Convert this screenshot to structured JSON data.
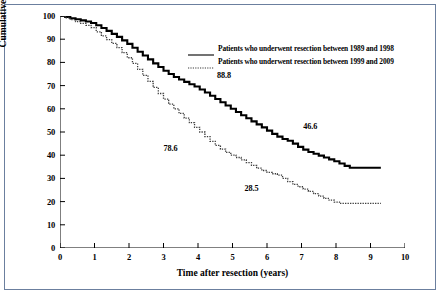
{
  "chart_data": {
    "type": "line",
    "title": "",
    "xlabel": "Time after resection (years)",
    "ylabel": "Cumulative survival (%)",
    "xlim": [
      0,
      10
    ],
    "ylim": [
      0,
      100
    ],
    "xticks": [
      "0",
      "1",
      "2",
      "3",
      "4",
      "5",
      "6",
      "7",
      "8",
      "9",
      "10"
    ],
    "yticks": [
      "0",
      "10",
      "20",
      "30",
      "40",
      "50",
      "60",
      "70",
      "80",
      "90",
      "100"
    ],
    "grid": false,
    "legend_position": "upper-right-inside",
    "series": [
      {
        "name": "Patients who underwent resection between 1989 and 1998",
        "style": "solid",
        "color": "#000000",
        "points": [
          [
            0.0,
            100.0
          ],
          [
            0.15,
            99.6
          ],
          [
            0.3,
            99.0
          ],
          [
            0.45,
            98.6
          ],
          [
            0.6,
            98.1
          ],
          [
            0.75,
            97.6
          ],
          [
            0.9,
            97.0
          ],
          [
            1.05,
            96.0
          ],
          [
            1.2,
            94.8
          ],
          [
            1.35,
            93.6
          ],
          [
            1.5,
            92.3
          ],
          [
            1.65,
            91.0
          ],
          [
            1.8,
            89.5
          ],
          [
            1.95,
            88.0
          ],
          [
            2.1,
            86.3
          ],
          [
            2.25,
            84.6
          ],
          [
            2.4,
            83.0
          ],
          [
            2.55,
            81.3
          ],
          [
            2.7,
            79.6
          ],
          [
            2.85,
            78.0
          ],
          [
            3.0,
            76.4
          ],
          [
            3.15,
            75.0
          ],
          [
            3.3,
            73.7
          ],
          [
            3.45,
            72.6
          ],
          [
            3.6,
            71.6
          ],
          [
            3.75,
            70.6
          ],
          [
            3.9,
            69.6
          ],
          [
            4.05,
            68.3
          ],
          [
            4.2,
            67.0
          ],
          [
            4.35,
            65.6
          ],
          [
            4.5,
            64.2
          ],
          [
            4.65,
            62.8
          ],
          [
            4.8,
            61.4
          ],
          [
            4.95,
            60.0
          ],
          [
            5.1,
            58.6
          ],
          [
            5.25,
            57.2
          ],
          [
            5.4,
            55.9
          ],
          [
            5.55,
            54.6
          ],
          [
            5.7,
            53.3
          ],
          [
            5.85,
            52.0
          ],
          [
            6.0,
            50.6
          ],
          [
            6.15,
            49.2
          ],
          [
            6.3,
            48.0
          ],
          [
            6.45,
            47.0
          ],
          [
            6.6,
            46.2
          ],
          [
            6.75,
            45.0
          ],
          [
            6.9,
            43.6
          ],
          [
            7.05,
            42.4
          ],
          [
            7.2,
            41.4
          ],
          [
            7.35,
            40.6
          ],
          [
            7.5,
            39.8
          ],
          [
            7.65,
            39.0
          ],
          [
            7.8,
            38.2
          ],
          [
            7.95,
            37.4
          ],
          [
            8.1,
            36.4
          ],
          [
            8.25,
            35.4
          ],
          [
            8.4,
            34.6
          ],
          [
            9.3,
            34.6
          ]
        ]
      },
      {
        "name": "Patients who underwent resection between 1999 and 2009",
        "style": "dotted",
        "color": "#3a3a3a",
        "points": [
          [
            0.0,
            100.0
          ],
          [
            0.15,
            99.2
          ],
          [
            0.3,
            98.4
          ],
          [
            0.45,
            97.6
          ],
          [
            0.6,
            96.8
          ],
          [
            0.75,
            96.0
          ],
          [
            0.9,
            95.0
          ],
          [
            1.05,
            93.2
          ],
          [
            1.2,
            91.4
          ],
          [
            1.35,
            89.8
          ],
          [
            1.5,
            88.2
          ],
          [
            1.65,
            86.4
          ],
          [
            1.8,
            84.2
          ],
          [
            1.95,
            82.0
          ],
          [
            2.1,
            79.6
          ],
          [
            2.25,
            77.0
          ],
          [
            2.4,
            74.4
          ],
          [
            2.55,
            71.8
          ],
          [
            2.7,
            69.2
          ],
          [
            2.85,
            66.6
          ],
          [
            3.0,
            64.2
          ],
          [
            3.15,
            62.0
          ],
          [
            3.3,
            60.0
          ],
          [
            3.45,
            58.0
          ],
          [
            3.6,
            56.0
          ],
          [
            3.75,
            54.0
          ],
          [
            3.9,
            52.0
          ],
          [
            4.05,
            50.0
          ],
          [
            4.2,
            48.0
          ],
          [
            4.35,
            46.0
          ],
          [
            4.5,
            44.2
          ],
          [
            4.65,
            42.6
          ],
          [
            4.8,
            41.2
          ],
          [
            4.95,
            40.0
          ],
          [
            5.1,
            39.0
          ],
          [
            5.25,
            38.0
          ],
          [
            5.4,
            36.8
          ],
          [
            5.55,
            35.6
          ],
          [
            5.7,
            34.4
          ],
          [
            5.85,
            33.4
          ],
          [
            6.0,
            32.6
          ],
          [
            6.15,
            32.0
          ],
          [
            6.3,
            31.4
          ],
          [
            6.45,
            30.0
          ],
          [
            6.6,
            28.6
          ],
          [
            6.75,
            27.4
          ],
          [
            6.9,
            26.4
          ],
          [
            7.05,
            25.4
          ],
          [
            7.2,
            24.4
          ],
          [
            7.35,
            23.4
          ],
          [
            7.5,
            22.4
          ],
          [
            7.65,
            21.4
          ],
          [
            7.8,
            20.6
          ],
          [
            7.95,
            19.8
          ],
          [
            8.1,
            19.2
          ],
          [
            9.3,
            19.2
          ]
        ]
      }
    ],
    "annotations": [
      {
        "label": "88.8",
        "x": 4.55,
        "y": 74.0
      },
      {
        "label": "46.6",
        "x": 7.05,
        "y": 52.0
      },
      {
        "label": "78.6",
        "x": 3.0,
        "y": 42.5
      },
      {
        "label": "28.5",
        "x": 5.35,
        "y": 25.5
      }
    ]
  },
  "legend": {
    "items": [
      {
        "label": "Patients who underwent resection between 1989 and 1998",
        "style": "solid"
      },
      {
        "label": "Patients who underwent resection between 1999 and 2009",
        "style": "dotted"
      }
    ]
  }
}
